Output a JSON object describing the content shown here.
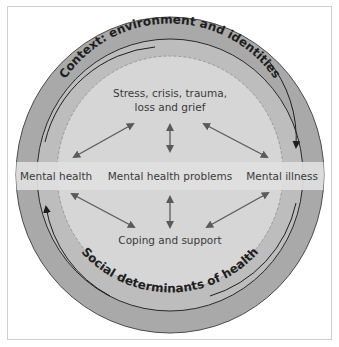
{
  "diagram": {
    "outer_ring_label": "Context: environment and identities",
    "inner_ring_label": "Social determinants of health",
    "top_label_line1": "Stress, crisis, trauma,",
    "top_label_line2": "loss and grief",
    "bottom_label": "Coping and support",
    "spectrum": {
      "left": "Mental health",
      "center": "Mental health problems",
      "right": "Mental illness"
    }
  },
  "colors": {
    "outer_ring": "#a9a9a9",
    "middle_ring": "#bdbdbd",
    "inner_disc": "#d6d6d6",
    "band": "#e0e0e0",
    "arrows": "#5a5a5a",
    "text": "#3a3a3a"
  }
}
